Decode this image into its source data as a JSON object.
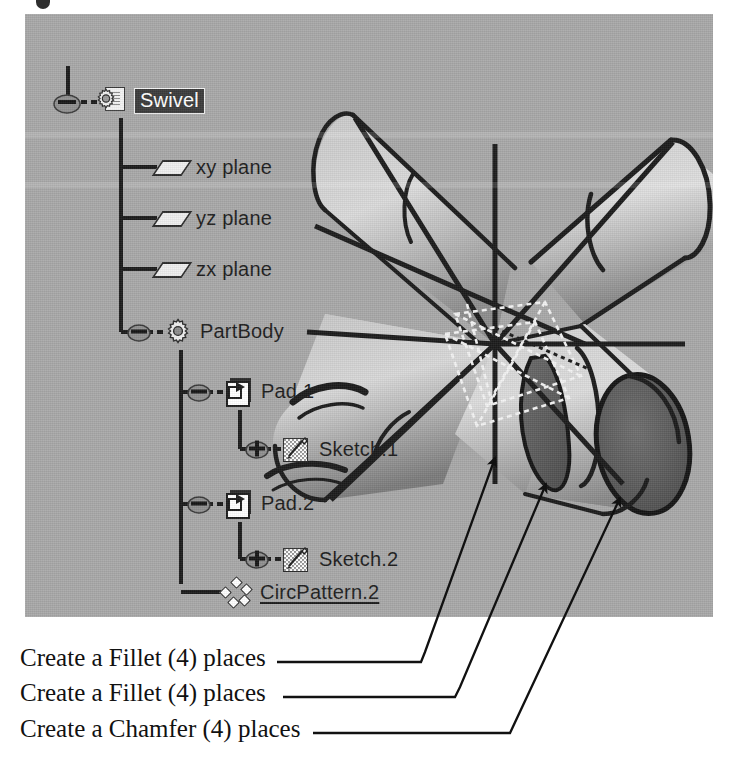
{
  "app": {
    "name": "CATIA",
    "view": "part-design-3d-viewport"
  },
  "tree": {
    "title": "specification-tree",
    "nodes": [
      {
        "label": "Swivel",
        "icon": "part-gear-document-icon",
        "level": 0,
        "selected": true,
        "expanded": true,
        "underlined": false,
        "handle": "minus"
      },
      {
        "label": "xy plane",
        "icon": "plane-icon",
        "level": 1,
        "selected": false,
        "expanded": false,
        "underlined": false,
        "handle": "none"
      },
      {
        "label": "yz plane",
        "icon": "plane-icon",
        "level": 1,
        "selected": false,
        "expanded": false,
        "underlined": false,
        "handle": "none"
      },
      {
        "label": "zx plane",
        "icon": "plane-icon",
        "level": 1,
        "selected": false,
        "expanded": false,
        "underlined": false,
        "handle": "none"
      },
      {
        "label": "PartBody",
        "icon": "partbody-gear-icon",
        "level": 1,
        "selected": false,
        "expanded": true,
        "underlined": false,
        "handle": "minus"
      },
      {
        "label": "Pad.1",
        "icon": "pad-icon",
        "level": 2,
        "selected": false,
        "expanded": true,
        "underlined": false,
        "handle": "minus"
      },
      {
        "label": "Sketch.1",
        "icon": "sketch-icon",
        "level": 3,
        "selected": false,
        "expanded": false,
        "underlined": false,
        "handle": "plus"
      },
      {
        "label": "Pad.2",
        "icon": "pad-icon",
        "level": 2,
        "selected": false,
        "expanded": true,
        "underlined": false,
        "handle": "minus"
      },
      {
        "label": "Sketch.2",
        "icon": "sketch-icon",
        "level": 3,
        "selected": false,
        "expanded": false,
        "underlined": false,
        "handle": "plus"
      },
      {
        "label": "CircPattern.2",
        "icon": "circular-pattern-icon",
        "level": 2,
        "selected": false,
        "expanded": false,
        "underlined": true,
        "handle": "none"
      }
    ]
  },
  "annotations": [
    {
      "text": "Create a Fillet (4) places",
      "target": "fillet-arm-junction"
    },
    {
      "text": "Create a Fillet (4) places",
      "target": "fillet-shoulder-ring"
    },
    {
      "text": "Create a Chamfer (4) places",
      "target": "chamfer-end-face"
    }
  ],
  "colors": {
    "viewport_background": "#a8a8a8",
    "model_light": "#d6d6d6",
    "model_mid": "#b4b4b4",
    "model_dark": "#6e6e6e",
    "model_end_face": "#5a5a5a",
    "edge": "#1b1b1b",
    "sketch_construction": "#f3f3f3",
    "selection_highlight": "#3b3b3b",
    "text": "#1d1d1d",
    "page_background": "#ffffff"
  }
}
